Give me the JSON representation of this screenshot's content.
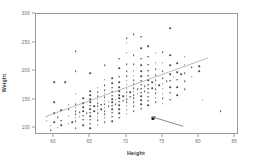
{
  "chart_data": {
    "type": "scatter",
    "title": "",
    "xlabel": "Height",
    "ylabel": "Weight",
    "xlim": [
      57.5,
      85.5
    ],
    "ylim": [
      88,
      300
    ],
    "xticks": [
      60,
      65,
      70,
      75,
      80,
      85
    ],
    "yticks": [
      100,
      150,
      200,
      250,
      300
    ],
    "grid": false,
    "legend": null,
    "point_color": "#4a4a4a",
    "frame_color": "#9a9a9a",
    "annotations": [
      {
        "name": "ascending-trend-line",
        "type": "line",
        "x0": 59.0,
        "y0": 118,
        "x1": 81.5,
        "y1": 222,
        "color": "#9a9a9a"
      },
      {
        "name": "descending-arrow",
        "type": "arrow",
        "x0": 78.0,
        "y0": 100,
        "x1": 73.6,
        "y1": 117,
        "color": "#6a6a6a"
      }
    ],
    "highlighted_points": [
      {
        "x": 73.6,
        "y": 117
      }
    ],
    "points": [
      [
        59.0,
        113
      ],
      [
        59.0,
        120
      ],
      [
        59.5,
        96
      ],
      [
        59.5,
        104
      ],
      [
        60.0,
        110
      ],
      [
        60.0,
        126
      ],
      [
        60.0,
        145
      ],
      [
        60.0,
        180
      ],
      [
        60.5,
        101
      ],
      [
        60.5,
        119
      ],
      [
        61.0,
        105
      ],
      [
        61.0,
        113
      ],
      [
        61.0,
        131
      ],
      [
        61.5,
        180
      ],
      [
        62.0,
        108
      ],
      [
        62.0,
        122
      ],
      [
        62.0,
        133
      ],
      [
        62.0,
        141
      ],
      [
        62.5,
        110
      ],
      [
        63.0,
        100
      ],
      [
        63.0,
        112
      ],
      [
        63.0,
        118
      ],
      [
        63.0,
        124
      ],
      [
        63.0,
        130
      ],
      [
        63.0,
        136
      ],
      [
        63.0,
        142
      ],
      [
        63.0,
        160
      ],
      [
        63.0,
        200
      ],
      [
        63.0,
        235
      ],
      [
        63.5,
        120
      ],
      [
        63.5,
        128
      ],
      [
        64.0,
        105
      ],
      [
        64.0,
        115
      ],
      [
        64.0,
        122
      ],
      [
        64.0,
        130
      ],
      [
        64.0,
        137
      ],
      [
        64.0,
        144
      ],
      [
        64.0,
        152
      ],
      [
        64.5,
        126
      ],
      [
        65.0,
        100
      ],
      [
        65.0,
        108
      ],
      [
        65.0,
        115
      ],
      [
        65.0,
        121
      ],
      [
        65.0,
        127
      ],
      [
        65.0,
        133
      ],
      [
        65.0,
        139
      ],
      [
        65.0,
        145
      ],
      [
        65.0,
        151
      ],
      [
        65.0,
        158
      ],
      [
        65.0,
        165
      ],
      [
        65.0,
        196
      ],
      [
        65.5,
        130
      ],
      [
        65.5,
        138
      ],
      [
        66.0,
        106
      ],
      [
        66.0,
        114
      ],
      [
        66.0,
        120
      ],
      [
        66.0,
        126
      ],
      [
        66.0,
        132
      ],
      [
        66.0,
        138
      ],
      [
        66.0,
        144
      ],
      [
        66.0,
        150
      ],
      [
        66.0,
        156
      ],
      [
        66.0,
        163
      ],
      [
        66.0,
        171
      ],
      [
        66.5,
        133
      ],
      [
        66.5,
        141
      ],
      [
        67.0,
        110
      ],
      [
        67.0,
        118
      ],
      [
        67.0,
        124
      ],
      [
        67.0,
        130
      ],
      [
        67.0,
        136
      ],
      [
        67.0,
        142
      ],
      [
        67.0,
        148
      ],
      [
        67.0,
        154
      ],
      [
        67.0,
        160
      ],
      [
        67.0,
        167
      ],
      [
        67.0,
        175
      ],
      [
        67.0,
        185
      ],
      [
        67.0,
        210
      ],
      [
        67.5,
        138
      ],
      [
        67.5,
        146
      ],
      [
        68.0,
        112
      ],
      [
        68.0,
        120
      ],
      [
        68.0,
        127
      ],
      [
        68.0,
        133
      ],
      [
        68.0,
        139
      ],
      [
        68.0,
        145
      ],
      [
        68.0,
        151
      ],
      [
        68.0,
        157
      ],
      [
        68.0,
        164
      ],
      [
        68.0,
        171
      ],
      [
        68.0,
        179
      ],
      [
        68.0,
        188
      ],
      [
        68.5,
        142
      ],
      [
        68.5,
        150
      ],
      [
        69.0,
        118
      ],
      [
        69.0,
        126
      ],
      [
        69.0,
        133
      ],
      [
        69.0,
        140
      ],
      [
        69.0,
        146
      ],
      [
        69.0,
        152
      ],
      [
        69.0,
        158
      ],
      [
        69.0,
        165
      ],
      [
        69.0,
        172
      ],
      [
        69.0,
        180
      ],
      [
        69.0,
        190
      ],
      [
        69.0,
        205
      ],
      [
        69.0,
        222
      ],
      [
        69.5,
        148
      ],
      [
        69.5,
        156
      ],
      [
        70.0,
        125
      ],
      [
        70.0,
        132
      ],
      [
        70.0,
        139
      ],
      [
        70.0,
        145
      ],
      [
        70.0,
        151
      ],
      [
        70.0,
        157
      ],
      [
        70.0,
        163
      ],
      [
        70.0,
        169
      ],
      [
        70.0,
        176
      ],
      [
        70.0,
        183
      ],
      [
        70.0,
        191
      ],
      [
        70.0,
        200
      ],
      [
        70.0,
        212
      ],
      [
        70.0,
        232
      ],
      [
        70.0,
        250
      ],
      [
        70.0,
        258
      ],
      [
        70.5,
        155
      ],
      [
        70.5,
        163
      ],
      [
        71.0,
        130
      ],
      [
        71.0,
        138
      ],
      [
        71.0,
        145
      ],
      [
        71.0,
        152
      ],
      [
        71.0,
        158
      ],
      [
        71.0,
        164
      ],
      [
        71.0,
        170
      ],
      [
        71.0,
        177
      ],
      [
        71.0,
        184
      ],
      [
        71.0,
        192
      ],
      [
        71.0,
        201
      ],
      [
        71.0,
        212
      ],
      [
        71.0,
        228
      ],
      [
        71.0,
        265
      ],
      [
        71.5,
        160
      ],
      [
        71.5,
        168
      ],
      [
        72.0,
        134
      ],
      [
        72.0,
        142
      ],
      [
        72.0,
        149
      ],
      [
        72.0,
        156
      ],
      [
        72.0,
        162
      ],
      [
        72.0,
        169
      ],
      [
        72.0,
        176
      ],
      [
        72.0,
        183
      ],
      [
        72.0,
        191
      ],
      [
        72.0,
        200
      ],
      [
        72.0,
        210
      ],
      [
        72.0,
        222
      ],
      [
        72.0,
        240
      ],
      [
        72.0,
        260
      ],
      [
        72.5,
        165
      ],
      [
        72.5,
        174
      ],
      [
        73.0,
        140
      ],
      [
        73.0,
        148
      ],
      [
        73.0,
        155
      ],
      [
        73.0,
        162
      ],
      [
        73.0,
        169
      ],
      [
        73.0,
        176
      ],
      [
        73.0,
        184
      ],
      [
        73.0,
        192
      ],
      [
        73.0,
        201
      ],
      [
        73.0,
        211
      ],
      [
        73.0,
        225
      ],
      [
        73.0,
        244
      ],
      [
        73.5,
        170
      ],
      [
        73.5,
        180
      ],
      [
        74.0,
        145
      ],
      [
        74.0,
        153
      ],
      [
        74.0,
        161
      ],
      [
        74.0,
        168
      ],
      [
        74.0,
        176
      ],
      [
        74.0,
        184
      ],
      [
        74.0,
        193
      ],
      [
        74.0,
        203
      ],
      [
        74.0,
        215
      ],
      [
        74.0,
        232
      ],
      [
        74.5,
        175
      ],
      [
        75.0,
        143
      ],
      [
        75.0,
        152
      ],
      [
        75.0,
        160
      ],
      [
        75.0,
        169
      ],
      [
        75.0,
        178
      ],
      [
        75.0,
        188
      ],
      [
        75.0,
        200
      ],
      [
        75.0,
        215
      ],
      [
        75.0,
        233
      ],
      [
        75.5,
        182
      ],
      [
        76.0,
        150
      ],
      [
        76.0,
        162
      ],
      [
        76.0,
        172
      ],
      [
        76.0,
        183
      ],
      [
        76.0,
        195
      ],
      [
        76.0,
        210
      ],
      [
        76.0,
        228
      ],
      [
        76.0,
        275
      ],
      [
        76.5,
        190
      ],
      [
        77.0,
        158
      ],
      [
        77.0,
        172
      ],
      [
        77.0,
        185
      ],
      [
        77.0,
        198
      ],
      [
        77.0,
        214
      ],
      [
        77.5,
        195
      ],
      [
        78.0,
        168
      ],
      [
        78.0,
        182
      ],
      [
        78.0,
        196
      ],
      [
        78.0,
        211
      ],
      [
        78.0,
        225
      ],
      [
        79.0,
        190
      ],
      [
        79.0,
        207
      ],
      [
        80.0,
        200
      ],
      [
        80.0,
        209
      ],
      [
        80.5,
        150
      ],
      [
        83.0,
        130
      ]
    ]
  }
}
